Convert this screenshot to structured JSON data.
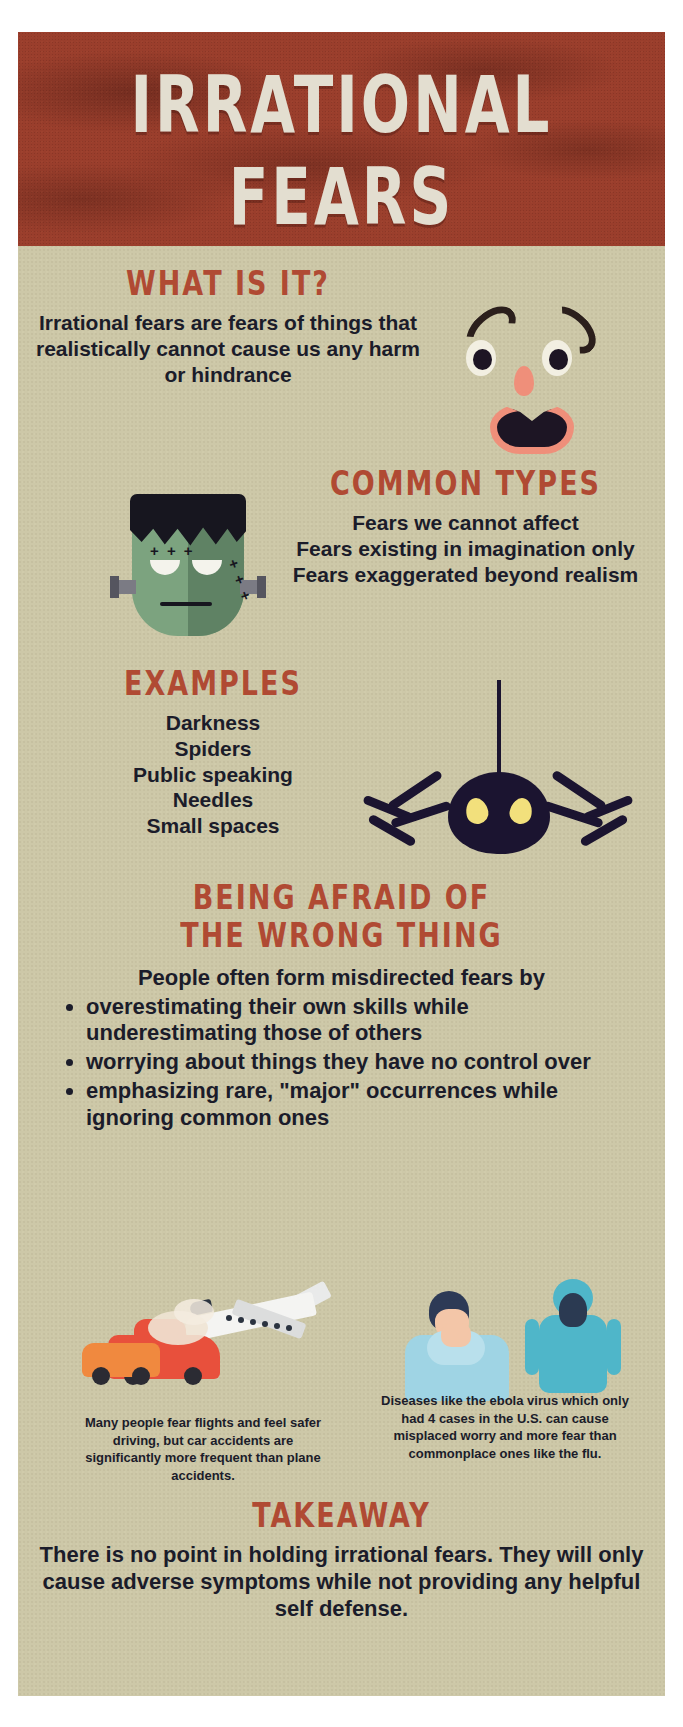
{
  "poster": {
    "title_line1": "IRRATIONAL",
    "title_line2": "FEARS",
    "colors": {
      "banner_bg": "#9a3e2c",
      "paper_bg": "#cdc8a8",
      "heading_red": "#b04a33",
      "body_navy": "#1b1c2a",
      "title_cream": "#e3ded0"
    }
  },
  "what_is_it": {
    "heading": "WHAT IS IT?",
    "body": "Irrational fears are fears of things that realistically cannot cause us any harm or hindrance"
  },
  "common_types": {
    "heading": "COMMON TYPES",
    "lines": [
      "Fears we cannot affect",
      "Fears existing in imagination only",
      "Fears exaggerated beyond realism"
    ]
  },
  "examples": {
    "heading": "EXAMPLES",
    "items": [
      "Darkness",
      "Spiders",
      "Public speaking",
      "Needles",
      "Small spaces"
    ]
  },
  "wrong_thing": {
    "heading_line1": "BEING AFRAID OF",
    "heading_line2": "THE WRONG THING",
    "intro": "People often form misdirected fears by",
    "bullets": [
      "overestimating their own skills while underestimating those of others",
      "worrying about things they have no control over",
      "emphasizing rare, \"major\" occurrences while ignoring common ones"
    ]
  },
  "illustrations": {
    "caption_left": "Many people fear flights and feel safer driving, but car accidents are significantly more frequent than plane accidents.",
    "caption_right": "Diseases like the ebola virus which only had 4 cases in the U.S. can cause misplaced worry and more fear than commonplace ones like the flu."
  },
  "takeaway": {
    "heading": "TAKEAWAY",
    "body": "There is no point in holding irrational fears. They will only cause adverse symptoms while not providing any helpful self defense."
  }
}
